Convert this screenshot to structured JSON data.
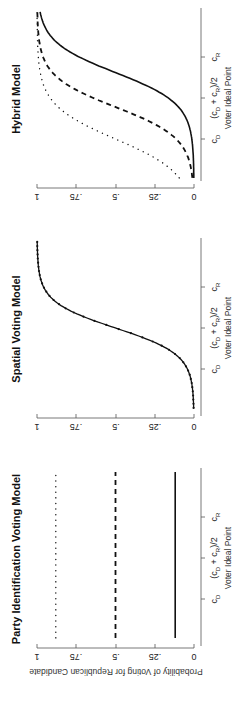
{
  "figure": {
    "orientation": "rotated-90-ccw",
    "shared_ylabel": "Probability of Voting for Republican Candidate"
  },
  "chart_data": [
    {
      "type": "line",
      "title": "Party Identification Voting Model",
      "xlabel": "Voter Ideal Point",
      "ylabel": "Probability of Voting for Republican Candidate",
      "x_ticks": [
        "c_D",
        "(c_D + c_R)/2",
        "c_R"
      ],
      "x_tick_positions": [
        -1,
        0,
        1
      ],
      "xlim": [
        -1.95,
        2.1
      ],
      "y_ticks": [
        "0",
        ".25",
        ".5",
        ".75",
        "1"
      ],
      "ylim": [
        0,
        1
      ],
      "series": [
        {
          "name": "solid",
          "style": "solid",
          "kind": "constant",
          "value": 0.12
        },
        {
          "name": "dashed",
          "style": "dashed",
          "kind": "constant",
          "value": 0.5
        },
        {
          "name": "dotted",
          "style": "dotted",
          "kind": "constant",
          "value": 0.88
        }
      ]
    },
    {
      "type": "line",
      "title": "Spatial Voting Model",
      "xlabel": "Voter Ideal Point",
      "ylabel": "",
      "x_ticks": [
        "c_D",
        "(c_D + c_R)/2",
        "c_R"
      ],
      "x_tick_positions": [
        -1,
        0,
        1
      ],
      "xlim": [
        -1.95,
        2.1
      ],
      "y_ticks": [
        "0",
        ".25",
        ".5",
        ".75",
        "1"
      ],
      "ylim": [
        0,
        1
      ],
      "series": [
        {
          "name": "all",
          "style": "solid-markers",
          "kind": "logistic",
          "center": 0.0,
          "scale": 0.32
        }
      ]
    },
    {
      "type": "line",
      "title": "Hybrid Model",
      "xlabel": "Voter Ideal Point",
      "ylabel": "",
      "x_ticks": [
        "c_D",
        "(c_D + c_R)/2",
        "c_R"
      ],
      "x_tick_positions": [
        -1,
        0,
        1
      ],
      "xlim": [
        -1.95,
        2.1
      ],
      "y_ticks": [
        "0",
        ".25",
        ".5",
        ".75",
        "1"
      ],
      "ylim": [
        0,
        1
      ],
      "series": [
        {
          "name": "solid",
          "style": "solid",
          "kind": "logistic",
          "center": 0.62,
          "scale": 0.38
        },
        {
          "name": "dashed",
          "style": "dashed",
          "kind": "logistic",
          "center": -0.22,
          "scale": 0.38
        },
        {
          "name": "dotted",
          "style": "dotted",
          "kind": "logistic",
          "center": -1.0,
          "scale": 0.42
        }
      ]
    }
  ],
  "panels": {
    "party": {
      "title": "Party Identification Voting Model",
      "xlabel": "Voter Ideal Point",
      "ylabel": "Probability of Voting for Republican Candidate",
      "x_ticks": {
        "cd": "c",
        "cd_sub": "D",
        "mid": "(c",
        "mid_sub1": "D",
        "mid_plus": " + c",
        "mid_sub2": "R",
        "mid_end": ")/2",
        "cr": "c",
        "cr_sub": "R"
      },
      "y_ticks": [
        "0",
        ".25",
        ".5",
        ".75",
        "1"
      ]
    },
    "spatial": {
      "title": "Spatial Voting Model",
      "xlabel": "Voter Ideal Point",
      "x_ticks": {
        "cd": "c",
        "cd_sub": "D",
        "mid": "(c",
        "mid_sub1": "D",
        "mid_plus": " + c",
        "mid_sub2": "R",
        "mid_end": ")/2",
        "cr": "c",
        "cr_sub": "R"
      },
      "y_ticks": [
        "0",
        ".25",
        ".5",
        ".75",
        "1"
      ]
    },
    "hybrid": {
      "title": "Hybrid Model",
      "xlabel": "Voter Ideal Point",
      "x_ticks": {
        "cd": "c",
        "cd_sub": "D",
        "mid": "(c",
        "mid_sub1": "D",
        "mid_plus": " + c",
        "mid_sub2": "R",
        "mid_end": ")/2",
        "cr": "c",
        "cr_sub": "R"
      },
      "y_ticks": [
        "0",
        ".25",
        ".5",
        ".75",
        "1"
      ]
    }
  }
}
